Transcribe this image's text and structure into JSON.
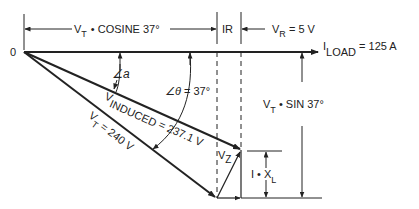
{
  "diagram": {
    "type": "phasor-vector-diagram",
    "origin_label": "0",
    "top_dimension": {
      "cosine_label_main": "V",
      "cosine_label_sub": "T",
      "cosine_label_rest": "•  COSINE 37°",
      "ir_label": "IR",
      "vr_label_main": "V",
      "vr_label_sub": "R",
      "vr_label_rest": " = 5 V"
    },
    "load_current": {
      "main": "I",
      "sub": "LOAD",
      "rest": " =  125 A"
    },
    "angle_a": {
      "symbol": "∠",
      "var": "a"
    },
    "angle_theta": {
      "symbol": "∠",
      "var": "θ",
      "rest": " = 37°"
    },
    "v_induced": {
      "main": "V",
      "sub": "INDUCED",
      "rest": "  =  237.1 V"
    },
    "v_total": {
      "main": "V",
      "sub": "T",
      "rest": "  =  240 V"
    },
    "v_z": {
      "main": "V",
      "sub": "Z"
    },
    "ixl": {
      "main": "I  •  X",
      "sub": "L"
    },
    "sine_dimension": {
      "main": "V",
      "sub": "T",
      "rest": "  •  SIN 37°"
    },
    "colors": {
      "line": "#222222",
      "background": "#ffffff"
    }
  }
}
